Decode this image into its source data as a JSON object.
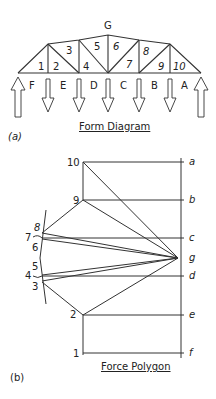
{
  "form_diagram": {
    "caption": "Form Diagram",
    "panel_label": "(a)",
    "top_label": "G",
    "space_numbers": [
      "1",
      "2",
      "3",
      "4",
      "5",
      "6",
      "7",
      "8",
      "9",
      "10"
    ],
    "load_letters": [
      "F",
      "E",
      "D",
      "C",
      "B",
      "A"
    ]
  },
  "force_polygon": {
    "caption": "Force Polygon",
    "panel_label": "(b)",
    "load_line_points": [
      "a",
      "b",
      "c",
      "d",
      "e",
      "f"
    ],
    "pole": "g",
    "node_numbers": [
      "10",
      "9",
      "8",
      "7",
      "6",
      "5",
      "4",
      "3",
      "2",
      "1"
    ]
  },
  "colors": {
    "line": "#333333",
    "background": "#ffffff"
  }
}
